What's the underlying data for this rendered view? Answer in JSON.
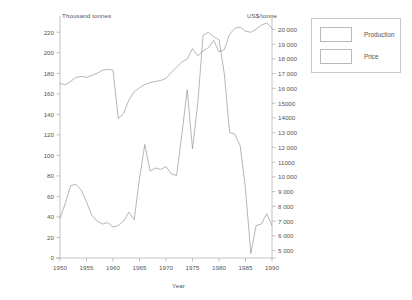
{
  "chart_data": {
    "type": "line",
    "title": "",
    "xlabel": "Year",
    "ylabel": "Thousand tonnes",
    "y2label": "US$/tonne",
    "xlim": [
      1950,
      1990
    ],
    "ylim": [
      0,
      230
    ],
    "y2lim": [
      4500,
      20500
    ],
    "grid": false,
    "legend_position": "top-right",
    "xticks": [
      "1950",
      "1955",
      "1960",
      "1965",
      "1970",
      "1975",
      "1980",
      "1985",
      "1990"
    ],
    "xtick_values": [
      1950,
      1955,
      1960,
      1965,
      1970,
      1975,
      1980,
      1985,
      1990
    ],
    "yticks": [
      "0",
      "20",
      "40",
      "60",
      "80",
      "100",
      "120",
      "140",
      "160",
      "180",
      "200",
      "220"
    ],
    "ytick_values": [
      0,
      20,
      40,
      60,
      80,
      100,
      120,
      140,
      160,
      180,
      200,
      220
    ],
    "y2ticks": [
      "5 000",
      "6 000",
      "7 000",
      "8 000",
      "9 000",
      "10 000",
      "11000",
      "12 000",
      "13 000",
      "14000",
      "15000",
      "16 000",
      "17 000",
      "18 000",
      "19 000",
      "20 000"
    ],
    "y2tick_values": [
      5000,
      6000,
      7000,
      8000,
      9000,
      10000,
      11000,
      12000,
      13000,
      14000,
      15000,
      16000,
      17000,
      18000,
      19000,
      20000
    ],
    "series": [
      {
        "name": "Production",
        "axis": "left",
        "units": "Thousand tonnes",
        "x": [
          1950,
          1951,
          1952,
          1953,
          1954,
          1955,
          1956,
          1957,
          1958,
          1959,
          1960,
          1961,
          1962,
          1963,
          1964,
          1965,
          1966,
          1967,
          1968,
          1969,
          1970,
          1971,
          1972,
          1973,
          1974,
          1975,
          1976,
          1977,
          1978,
          1979,
          1980,
          1981,
          1982,
          1983,
          1984,
          1985,
          1986,
          1987,
          1988,
          1989,
          1990
        ],
        "values": [
          170,
          169,
          172,
          176,
          177,
          176,
          178,
          180,
          183,
          184,
          183,
          136,
          141,
          154,
          162,
          166,
          169,
          171,
          172,
          173,
          175,
          181,
          186,
          191,
          194,
          204,
          197,
          202,
          205,
          212,
          201,
          203,
          218,
          224,
          225,
          221,
          220,
          223,
          227,
          229,
          224
        ]
      },
      {
        "name": "Price",
        "axis": "right",
        "units": "US$/tonne",
        "x": [
          1950,
          1951,
          1952,
          1953,
          1954,
          1955,
          1956,
          1957,
          1958,
          1959,
          1960,
          1961,
          1962,
          1963,
          1964,
          1965,
          1966,
          1967,
          1968,
          1969,
          1970,
          1971,
          1972,
          1973,
          1974,
          1975,
          1976,
          1977,
          1978,
          1979,
          1980,
          1981,
          1982,
          1983,
          1984,
          1985,
          1986,
          1987,
          1988,
          1989,
          1990
        ],
        "values": [
          7200,
          8200,
          9400,
          9500,
          9100,
          8300,
          7400,
          7000,
          6800,
          6900,
          6600,
          6700,
          7000,
          7600,
          7100,
          9900,
          12200,
          10400,
          10600,
          10500,
          10700,
          10200,
          10100,
          12900,
          15900,
          11900,
          15000,
          19600,
          19800,
          19500,
          19300,
          17000,
          13000,
          12900,
          12100,
          9200,
          4800,
          6700,
          6800,
          7500,
          6700
        ]
      }
    ]
  },
  "legend": {
    "items": [
      {
        "label": "Production"
      },
      {
        "label": "Price"
      }
    ]
  },
  "axes": {
    "left_title": "Thousand tonnes",
    "right_title": "US$/tonne",
    "x_title": "Year"
  },
  "colors": {
    "line": "#8e8e8e",
    "axis": "#9a9a9a",
    "text": "#555555",
    "background": "#ffffff",
    "legend_border": "#c9c9c9"
  }
}
